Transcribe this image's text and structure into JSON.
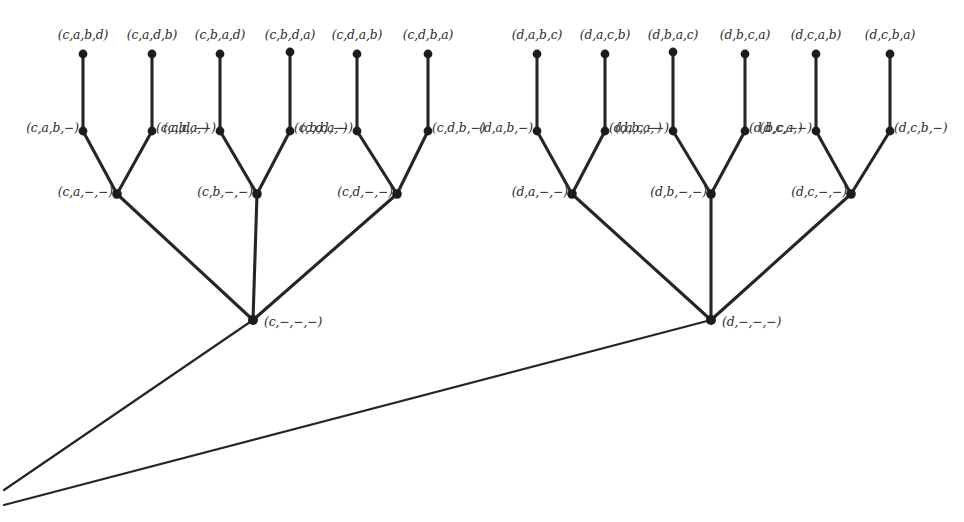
{
  "figure": {
    "kind": "permutation-tree-diagram",
    "background_color": "#ffffff",
    "line_color": "#262626",
    "node_color": "#1c1c1c",
    "text_color": "#2a2a2a",
    "width": 964,
    "height": 522
  },
  "nodes": {
    "leaves": [
      {
        "id": "l1",
        "label": "(c,a,b,d)",
        "x": 83,
        "y": 54,
        "label_x": 83,
        "label_y": 35,
        "align": "center"
      },
      {
        "id": "l2",
        "label": "(c,a,d,b)",
        "x": 152,
        "y": 54,
        "label_x": 152,
        "label_y": 35,
        "align": "center"
      },
      {
        "id": "l3",
        "label": "(c,b,a,d)",
        "x": 220,
        "y": 54,
        "label_x": 220,
        "label_y": 35,
        "align": "center"
      },
      {
        "id": "l4",
        "label": "(c,b,d,a)",
        "x": 290,
        "y": 52,
        "label_x": 290,
        "label_y": 35,
        "align": "center"
      },
      {
        "id": "l5",
        "label": "(c,d,a,b)",
        "x": 357,
        "y": 54,
        "label_x": 357,
        "label_y": 35,
        "align": "center"
      },
      {
        "id": "l6",
        "label": "(c,d,b,a)",
        "x": 428,
        "y": 54,
        "label_x": 428,
        "label_y": 35,
        "align": "center"
      },
      {
        "id": "l7",
        "label": "(d,a,b,c)",
        "x": 537,
        "y": 54,
        "label_x": 537,
        "label_y": 35,
        "align": "center"
      },
      {
        "id": "l8",
        "label": "(d,a,c,b)",
        "x": 605,
        "y": 54,
        "label_x": 605,
        "label_y": 35,
        "align": "center"
      },
      {
        "id": "l9",
        "label": "(d,b,a,c)",
        "x": 673,
        "y": 52,
        "label_x": 673,
        "label_y": 35,
        "align": "center"
      },
      {
        "id": "l10",
        "label": "(d,b,c,a)",
        "x": 745,
        "y": 54,
        "label_x": 745,
        "label_y": 35,
        "align": "center"
      },
      {
        "id": "l11",
        "label": "(d,c,a,b)",
        "x": 816,
        "y": 54,
        "label_x": 816,
        "label_y": 35,
        "align": "center"
      },
      {
        "id": "l12",
        "label": "(d,c,b,a)",
        "x": 890,
        "y": 54,
        "label_x": 890,
        "label_y": 35,
        "align": "center"
      }
    ],
    "level2": [
      {
        "id": "m1",
        "label": "(c,a,b,−)",
        "x": 83,
        "y": 131,
        "label_x": 79,
        "label_y": 128,
        "align": "right"
      },
      {
        "id": "m2",
        "label": "(c,a,d,−)",
        "x": 152,
        "y": 131,
        "label_x": 156,
        "label_y": 128,
        "align": "left"
      },
      {
        "id": "m3",
        "label": "(c,b,a,−)",
        "x": 220,
        "y": 131,
        "label_x": 216,
        "label_y": 128,
        "align": "right"
      },
      {
        "id": "m4",
        "label": "(c,b,d,−)",
        "x": 290,
        "y": 131,
        "label_x": 294,
        "label_y": 128,
        "align": "left"
      },
      {
        "id": "m5",
        "label": "(c,d,a,−)",
        "x": 357,
        "y": 131,
        "label_x": 353,
        "label_y": 128,
        "align": "right"
      },
      {
        "id": "m6",
        "label": "(c,d,b,−)",
        "x": 428,
        "y": 131,
        "label_x": 432,
        "label_y": 128,
        "align": "left"
      },
      {
        "id": "m7",
        "label": "(d,a,b,−)",
        "x": 537,
        "y": 131,
        "label_x": 533,
        "label_y": 128,
        "align": "right"
      },
      {
        "id": "m8",
        "label": "(d,a,c,−)",
        "x": 605,
        "y": 131,
        "label_x": 609,
        "label_y": 128,
        "align": "left"
      },
      {
        "id": "m9",
        "label": "(d,b,a,−)",
        "x": 673,
        "y": 131,
        "label_x": 669,
        "label_y": 128,
        "align": "right"
      },
      {
        "id": "m10",
        "label": "(d,b,c,−)",
        "x": 745,
        "y": 131,
        "label_x": 749,
        "label_y": 128,
        "align": "left"
      },
      {
        "id": "m11",
        "label": "(d,c,a,−)",
        "x": 816,
        "y": 131,
        "label_x": 812,
        "label_y": 128,
        "align": "right"
      },
      {
        "id": "m12",
        "label": "(d,c,b,−)",
        "x": 890,
        "y": 131,
        "label_x": 894,
        "label_y": 128,
        "align": "left"
      }
    ],
    "level3": [
      {
        "id": "n1",
        "label": "(c,a,−,−)",
        "x": 117,
        "y": 194,
        "label_x": 113,
        "label_y": 192,
        "align": "right"
      },
      {
        "id": "n2",
        "label": "(c,b,−,−)",
        "x": 257,
        "y": 194,
        "label_x": 253,
        "label_y": 192,
        "align": "right"
      },
      {
        "id": "n3",
        "label": "(c,d,−,−)",
        "x": 397,
        "y": 194,
        "label_x": 393,
        "label_y": 192,
        "align": "right"
      },
      {
        "id": "n4",
        "label": "(d,a,−,−)",
        "x": 572,
        "y": 194,
        "label_x": 568,
        "label_y": 192,
        "align": "right"
      },
      {
        "id": "n5",
        "label": "(d,b,−,−)",
        "x": 711,
        "y": 194,
        "label_x": 707,
        "label_y": 192,
        "align": "right"
      },
      {
        "id": "n6",
        "label": "(d,c,−,−)",
        "x": 851,
        "y": 194,
        "label_x": 847,
        "label_y": 192,
        "align": "right"
      }
    ],
    "level4": [
      {
        "id": "r1",
        "label": "(c,−,−,−)",
        "x": 253,
        "y": 320,
        "label_x": 264,
        "label_y": 322,
        "align": "left"
      },
      {
        "id": "r2",
        "label": "(d,−,−,−)",
        "x": 711,
        "y": 320,
        "label_x": 722,
        "label_y": 322,
        "align": "left"
      }
    ]
  },
  "edges": {
    "leaf_to_level2": [
      {
        "x1": 83,
        "y1": 54,
        "x2": 83,
        "y2": 131
      },
      {
        "x1": 152,
        "y1": 54,
        "x2": 152,
        "y2": 131
      },
      {
        "x1": 220,
        "y1": 54,
        "x2": 220,
        "y2": 131
      },
      {
        "x1": 290,
        "y1": 52,
        "x2": 290,
        "y2": 131
      },
      {
        "x1": 357,
        "y1": 54,
        "x2": 357,
        "y2": 131
      },
      {
        "x1": 428,
        "y1": 54,
        "x2": 428,
        "y2": 131
      },
      {
        "x1": 537,
        "y1": 54,
        "x2": 537,
        "y2": 131
      },
      {
        "x1": 605,
        "y1": 54,
        "x2": 605,
        "y2": 131
      },
      {
        "x1": 673,
        "y1": 52,
        "x2": 673,
        "y2": 131
      },
      {
        "x1": 745,
        "y1": 54,
        "x2": 745,
        "y2": 131
      },
      {
        "x1": 816,
        "y1": 54,
        "x2": 816,
        "y2": 131
      },
      {
        "x1": 890,
        "y1": 54,
        "x2": 890,
        "y2": 131
      }
    ],
    "level2_to_level3": [
      {
        "x1": 83,
        "y1": 131,
        "x2": 117,
        "y2": 194
      },
      {
        "x1": 152,
        "y1": 131,
        "x2": 117,
        "y2": 194
      },
      {
        "x1": 220,
        "y1": 131,
        "x2": 257,
        "y2": 194
      },
      {
        "x1": 290,
        "y1": 131,
        "x2": 257,
        "y2": 194
      },
      {
        "x1": 357,
        "y1": 131,
        "x2": 397,
        "y2": 194
      },
      {
        "x1": 428,
        "y1": 131,
        "x2": 397,
        "y2": 194
      },
      {
        "x1": 537,
        "y1": 131,
        "x2": 572,
        "y2": 194
      },
      {
        "x1": 605,
        "y1": 131,
        "x2": 572,
        "y2": 194
      },
      {
        "x1": 673,
        "y1": 131,
        "x2": 711,
        "y2": 194
      },
      {
        "x1": 745,
        "y1": 131,
        "x2": 711,
        "y2": 194
      },
      {
        "x1": 816,
        "y1": 131,
        "x2": 851,
        "y2": 194
      },
      {
        "x1": 890,
        "y1": 131,
        "x2": 851,
        "y2": 194
      }
    ],
    "level3_to_level4": [
      {
        "x1": 117,
        "y1": 194,
        "x2": 253,
        "y2": 320
      },
      {
        "x1": 257,
        "y1": 194,
        "x2": 253,
        "y2": 320
      },
      {
        "x1": 397,
        "y1": 194,
        "x2": 253,
        "y2": 320
      },
      {
        "x1": 572,
        "y1": 194,
        "x2": 711,
        "y2": 320
      },
      {
        "x1": 711,
        "y1": 194,
        "x2": 711,
        "y2": 320
      },
      {
        "x1": 851,
        "y1": 194,
        "x2": 711,
        "y2": 320
      }
    ],
    "level4_to_root": [
      {
        "x1": 253,
        "y1": 320,
        "x2": 4,
        "y2": 490
      },
      {
        "x1": 711,
        "y1": 320,
        "x2": 4,
        "y2": 505
      }
    ]
  }
}
